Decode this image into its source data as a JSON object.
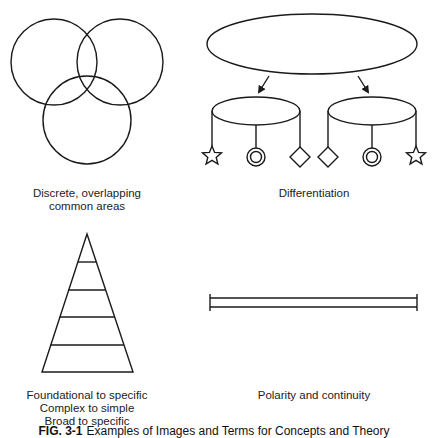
{
  "figure": {
    "caption_label": "FIG. 3-1",
    "caption_text": "Examples of Images and Terms for Concepts and Theory",
    "stroke_color": "#1a1a1a",
    "background": "#ffffff"
  },
  "panels": [
    {
      "id": "overlap",
      "shape": "three-overlapping-circles",
      "label_lines": [
        "Discrete, overlapping",
        "common areas"
      ]
    },
    {
      "id": "differentiation",
      "shape": "ellipse-branching-to-two-mobiles",
      "label_lines": [
        "Differentiation"
      ],
      "left_mobile_symbols": [
        "star",
        "double-circle",
        "diamond"
      ],
      "right_mobile_symbols": [
        "diamond",
        "double-circle",
        "star"
      ]
    },
    {
      "id": "pyramid",
      "shape": "layered-triangle",
      "layers": 5,
      "label_lines": [
        "Foundational to specific",
        "Complex to simple",
        "Broad to specific"
      ]
    },
    {
      "id": "polarity",
      "shape": "double-line-bar",
      "label_lines": [
        "Polarity and continuity"
      ]
    }
  ]
}
